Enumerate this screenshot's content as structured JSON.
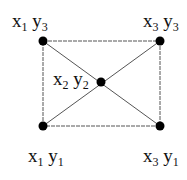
{
  "diagram": {
    "nodes": [
      {
        "id": "tl",
        "x": 43,
        "y": 41,
        "label_x": "x",
        "label_x_sub": "1",
        "label_y": "y",
        "label_y_sub": "3",
        "lx": 12,
        "ly": 27
      },
      {
        "id": "tr",
        "x": 160,
        "y": 41,
        "label_x": "x",
        "label_x_sub": "3",
        "label_y": "y",
        "label_y_sub": "3",
        "lx": 143,
        "ly": 27
      },
      {
        "id": "c",
        "x": 101,
        "y": 82,
        "label_x": "x",
        "label_x_sub": "2",
        "label_y": "y",
        "label_y_sub": "2",
        "lx": 53,
        "ly": 85
      },
      {
        "id": "bl",
        "x": 43,
        "y": 126,
        "label_x": "x",
        "label_x_sub": "1",
        "label_y": "y",
        "label_y_sub": "1",
        "lx": 28,
        "ly": 162
      },
      {
        "id": "br",
        "x": 160,
        "y": 126,
        "label_x": "x",
        "label_x_sub": "3",
        "label_y": "y",
        "label_y_sub": "1",
        "lx": 143,
        "ly": 162
      }
    ],
    "edges": [
      {
        "from": "tl",
        "to": "tr",
        "style": "dashed"
      },
      {
        "from": "tr",
        "to": "br",
        "style": "dashed"
      },
      {
        "from": "br",
        "to": "bl",
        "style": "dashed"
      },
      {
        "from": "bl",
        "to": "tl",
        "style": "dashed"
      },
      {
        "from": "tl",
        "to": "br",
        "style": "solid"
      },
      {
        "from": "bl",
        "to": "tr",
        "style": "solid"
      }
    ],
    "colors": {
      "node": "#000000",
      "edge": "#555555",
      "text": "#111111"
    }
  }
}
